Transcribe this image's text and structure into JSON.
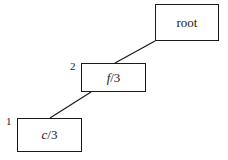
{
  "diagram": {
    "type": "tree",
    "nodes": [
      {
        "id": "root",
        "label": "root",
        "italic_part": "",
        "rest": "root",
        "index": ""
      },
      {
        "id": "f",
        "label": "f/3",
        "italic_part": "f",
        "rest": "/3",
        "index": "2"
      },
      {
        "id": "c",
        "label": "c/3",
        "italic_part": "c",
        "rest": "/3",
        "index": "1"
      }
    ],
    "edges": [
      {
        "from": "root",
        "to": "f"
      },
      {
        "from": "f",
        "to": "c"
      }
    ]
  }
}
